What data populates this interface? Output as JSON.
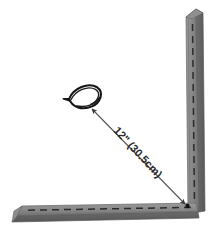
{
  "diagram": {
    "background_color": "#ffffff",
    "dimension": {
      "label": "12\" (30.5cm)",
      "value_imperial": "12\"",
      "value_metric": "(30.5cm)",
      "line_color": "#555555",
      "text_color": "#2a2a2a",
      "rotation_deg": 47
    },
    "wall_vertical": {
      "name": "vertical wall",
      "face_color": "#8a8a8a",
      "edge_color": "#6a6a6a",
      "shadow_color": "#5e5e5e",
      "dash_color": "#2e2e2e"
    },
    "wall_horizontal": {
      "name": "floor",
      "face_color": "#8a8a8a",
      "edge_color": "#6a6a6a",
      "shadow_color": "#5e5e5e",
      "dash_color": "#2e2e2e"
    },
    "device": {
      "name": "sprinkler-head",
      "outline_color": "#1a1a1a",
      "fill_color": "#ffffff"
    },
    "corner_point": {
      "name": "inside-corner",
      "color": "#111111"
    }
  }
}
